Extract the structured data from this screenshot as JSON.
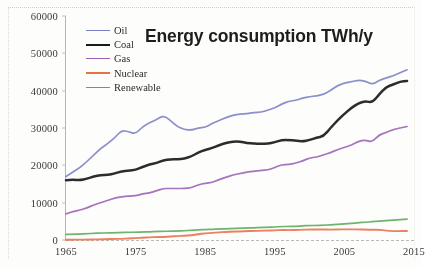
{
  "chart_data": {
    "type": "line",
    "title": "Energy consumption TWh/y",
    "xlabel": "",
    "ylabel": "",
    "xlim": [
      1965,
      2015
    ],
    "ylim": [
      0,
      60000
    ],
    "grid": false,
    "legend_position": "upper-left-inside",
    "x_ticks": [
      "1965",
      "1975",
      "1985",
      "1995",
      "2005",
      "2015"
    ],
    "x_tick_values": [
      1965,
      1975,
      1985,
      1995,
      2005,
      2015
    ],
    "x_last_tick_clipped": true,
    "y_ticks": [
      "0",
      "10000",
      "20000",
      "30000",
      "40000",
      "50000",
      "60000"
    ],
    "y_tick_values": [
      0,
      10000,
      20000,
      30000,
      40000,
      50000,
      60000
    ],
    "x": [
      1965,
      1966,
      1967,
      1968,
      1969,
      1970,
      1971,
      1972,
      1973,
      1974,
      1975,
      1976,
      1977,
      1978,
      1979,
      1980,
      1981,
      1982,
      1983,
      1984,
      1985,
      1986,
      1987,
      1988,
      1989,
      1990,
      1991,
      1992,
      1993,
      1994,
      1995,
      1996,
      1997,
      1998,
      1999,
      2000,
      2001,
      2002,
      2003,
      2004,
      2005,
      2006,
      2007,
      2008,
      2009,
      2010,
      2011,
      2012,
      2013,
      2014
    ],
    "series": [
      {
        "name": "Oil",
        "color": "#7b7fc4",
        "values": [
          17000,
          18200,
          19400,
          21000,
          22800,
          24600,
          25800,
          27400,
          29400,
          29000,
          28400,
          30400,
          31400,
          32200,
          33400,
          32000,
          30400,
          29600,
          29400,
          30000,
          30200,
          31200,
          32000,
          32800,
          33400,
          33800,
          33800,
          34200,
          34200,
          34800,
          35400,
          36400,
          37200,
          37400,
          38000,
          38400,
          38600,
          39000,
          40000,
          41400,
          42000,
          42400,
          42800,
          42600,
          41600,
          42800,
          43400,
          44000,
          44800,
          45600
        ]
      },
      {
        "name": "Coal",
        "color": "#1a1a1a",
        "values": [
          16000,
          16200,
          16000,
          16400,
          17000,
          17400,
          17400,
          17800,
          18400,
          18600,
          18800,
          19600,
          20200,
          20600,
          21400,
          21600,
          21600,
          21800,
          22400,
          23400,
          24200,
          24600,
          25400,
          26000,
          26400,
          26400,
          26000,
          25800,
          25800,
          25800,
          26200,
          26800,
          26800,
          26600,
          26400,
          26800,
          27400,
          27800,
          30000,
          32000,
          33800,
          35400,
          36600,
          37200,
          36800,
          39000,
          41000,
          41600,
          42400,
          42600
        ]
      },
      {
        "name": "Gas",
        "color": "#9b5fb5",
        "values": [
          7000,
          7600,
          8000,
          8600,
          9400,
          10000,
          10600,
          11200,
          11600,
          11800,
          11800,
          12400,
          12600,
          13200,
          13800,
          13800,
          13800,
          13800,
          14000,
          14800,
          15200,
          15400,
          16200,
          16800,
          17400,
          17800,
          18200,
          18400,
          18600,
          18800,
          19400,
          20200,
          20200,
          20600,
          21200,
          22000,
          22200,
          22800,
          23400,
          24200,
          24800,
          25400,
          26400,
          26800,
          26200,
          28200,
          28800,
          29600,
          30000,
          30400
        ]
      },
      {
        "name": "Nuclear",
        "color": "#e8704a",
        "values": [
          200,
          240,
          280,
          340,
          420,
          500,
          620,
          760,
          920,
          1160,
          1480,
          1680,
          2000,
          2240,
          2320,
          2560,
          2960,
          3160,
          3560,
          4320,
          4960,
          5280,
          5680,
          6080,
          6240,
          6400,
          6640,
          6720,
          6880,
          7040,
          7200,
          7440,
          7360,
          7440,
          7680,
          7760,
          7840,
          7840,
          7680,
          7920,
          7920,
          7920,
          7840,
          7760,
          7600,
          7680,
          7040,
          6560,
          6640,
          6720
        ],
        "values_note": "rendered on same 0-60000 axis; curve runs just above baseline reaching ~2500 TWh/y equivalent visual height"
      },
      {
        "name": "Renewable",
        "color": "#5aa85a",
        "values": [
          1500,
          1560,
          1620,
          1700,
          1780,
          1860,
          1900,
          1960,
          2020,
          2060,
          2100,
          2140,
          2200,
          2280,
          2320,
          2360,
          2420,
          2480,
          2600,
          2720,
          2820,
          2880,
          2960,
          3020,
          3100,
          3160,
          3200,
          3260,
          3340,
          3420,
          3520,
          3580,
          3640,
          3700,
          3780,
          3880,
          3900,
          3980,
          4060,
          4200,
          4340,
          4460,
          4620,
          4780,
          4860,
          5080,
          5200,
          5340,
          5480,
          5600
        ]
      }
    ]
  },
  "legend": {
    "items": [
      {
        "label": "Oil",
        "color": "#7b7fc4",
        "width": 1.6
      },
      {
        "label": "Coal",
        "color": "#1a1a1a",
        "width": 2.6
      },
      {
        "label": "Gas",
        "color": "#9b5fb5",
        "width": 1.7
      },
      {
        "label": "Nuclear",
        "color": "#e8704a",
        "width": 2.0
      },
      {
        "label": "Renewable",
        "color": "#5aa85a",
        "width": 1.6
      }
    ]
  }
}
